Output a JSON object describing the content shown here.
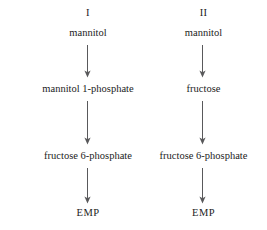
{
  "figure": {
    "line_color": "#59595b",
    "text_color": "#1c1c1c",
    "background": "#ffffff"
  },
  "pathways": [
    {
      "id": "pathway-one",
      "header": "I",
      "steps": [
        {
          "label": "mannitol"
        },
        {
          "label": "mannitol 1-phosphate"
        },
        {
          "label": "fructose 6-phosphate"
        },
        {
          "label": "EMP"
        }
      ],
      "arrows": [
        {
          "name": "arrow-down-1",
          "from": "mannitol",
          "to": "mannitol 1-phosphate"
        },
        {
          "name": "arrow-down-2",
          "from": "mannitol 1-phosphate",
          "to": "fructose 6-phosphate"
        },
        {
          "name": "arrow-down-3",
          "from": "fructose 6-phosphate",
          "to": "EMP"
        }
      ]
    },
    {
      "id": "pathway-two",
      "header": "II",
      "steps": [
        {
          "label": "mannitol"
        },
        {
          "label": "fructose"
        },
        {
          "label": "fructose 6-phosphate"
        },
        {
          "label": "EMP"
        }
      ],
      "arrows": [
        {
          "name": "arrow-down-1",
          "from": "mannitol",
          "to": "fructose"
        },
        {
          "name": "arrow-down-2",
          "from": "fructose",
          "to": "fructose 6-phosphate"
        },
        {
          "name": "arrow-down-3",
          "from": "fructose 6-phosphate",
          "to": "EMP"
        }
      ]
    }
  ]
}
